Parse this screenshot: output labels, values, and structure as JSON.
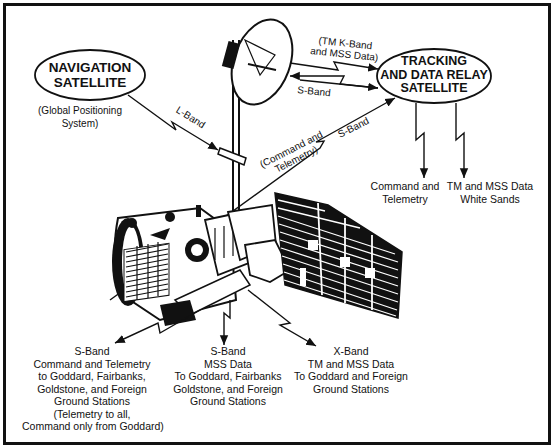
{
  "diagram": {
    "nodes": {
      "navigation": {
        "title_line1": "NAVIGATION",
        "title_line2": "SATELLITE",
        "note_line1": "(Global Positioning",
        "note_line2": "System)"
      },
      "tdrs": {
        "title_line1": "TRACKING",
        "title_line2": "AND DATA RELAY",
        "title_line3": "SATELLITE"
      }
    },
    "links": {
      "l_band": "L-Band",
      "tm_kband_line1": "(TM K-Band",
      "tm_kband_line2": "and MSS Data)",
      "s_band_antenna": "S-Band",
      "command_telemetry_line1": "(Command and",
      "command_telemetry_line2": "Telemetry)",
      "s_band_relay": "S-Band"
    },
    "tdrs_outputs": {
      "left_line1": "Command and",
      "left_line2": "Telemetry",
      "right_line1": "TM and MSS Data",
      "right_line2": "White Sands"
    },
    "ground": {
      "left": [
        "S-Band",
        "Command and Telemetry",
        "to Goddard, Fairbanks,",
        "Goldstone, and Foreign",
        "Ground Stations",
        "(Telemetry to all,",
        "Command only from Goddard)"
      ],
      "center": [
        "S-Band",
        "MSS Data",
        "To Goddard, Fairbanks",
        "Goldstone, and Foreign",
        "Ground Stations"
      ],
      "right": [
        "X-Band",
        "TM and MSS Data",
        "To Goddard and Foreign",
        "Ground Stations"
      ]
    }
  }
}
